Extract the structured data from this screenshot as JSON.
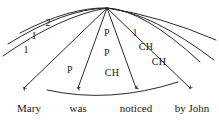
{
  "diagram": {
    "type": "stratificational-arc-diagram",
    "stroke_color": "#2a2a2a",
    "background_color": "#ffffff",
    "text_color": "#1a1a1a",
    "apex": {
      "x": 107,
      "y": 8
    },
    "words": [
      {
        "id": "word-mary",
        "label": "Mary",
        "x": 29,
        "y": 108
      },
      {
        "id": "word-was",
        "label": "was",
        "x": 78,
        "y": 108
      },
      {
        "id": "word-noticed",
        "label": "noticed",
        "x": 136,
        "y": 108
      },
      {
        "id": "word-by-john",
        "label": "by John",
        "x": 192,
        "y": 108
      }
    ],
    "cell_labels": [
      {
        "id": "label-2",
        "text": "2",
        "x": 48,
        "y": 23,
        "kind": "number"
      },
      {
        "id": "label-1-upper",
        "text": "1",
        "x": 34,
        "y": 36,
        "kind": "number"
      },
      {
        "id": "label-1-lower",
        "text": "1",
        "x": 26,
        "y": 50,
        "kind": "number"
      },
      {
        "id": "label-p-top",
        "text": "P",
        "x": 107,
        "y": 33,
        "kind": "relation"
      },
      {
        "id": "label-1-right",
        "text": "1",
        "x": 135,
        "y": 33,
        "kind": "number"
      },
      {
        "id": "label-p-mid",
        "text": "P",
        "x": 107,
        "y": 53,
        "kind": "relation"
      },
      {
        "id": "label-ch-top",
        "text": "CH",
        "x": 146,
        "y": 47,
        "kind": "relation"
      },
      {
        "id": "label-p-left",
        "text": "P",
        "x": 70,
        "y": 70,
        "kind": "relation"
      },
      {
        "id": "label-ch-mid",
        "text": "CH",
        "x": 112,
        "y": 73,
        "kind": "relation"
      },
      {
        "id": "label-ch-low",
        "text": "CH",
        "x": 159,
        "y": 62,
        "kind": "relation"
      }
    ],
    "arcs": [
      {
        "id": "arc-outer",
        "d": "M 3 56 Q 60 16 107 8 Q 160 16 216 40"
      },
      {
        "id": "arc-middle",
        "d": "M 8 44 Q 64 9 107 8 Q 152 13 214 60"
      },
      {
        "id": "arc-inner",
        "d": "M 20 33 Q 70 7 107 8 Q 144 10 200 62"
      },
      {
        "id": "arc-base",
        "d": "M 47 90 Q 110 104 178 82"
      }
    ],
    "rays": [
      {
        "id": "ray-mary",
        "d": "M 107 8 L 24 86",
        "arrow": true
      },
      {
        "id": "ray-was",
        "d": "M 107 8 L 78 86",
        "arrow": true
      },
      {
        "id": "ray-noticed",
        "d": "M 107 8 L 136 86",
        "arrow": true
      },
      {
        "id": "ray-by-john",
        "d": "M 107 8 L 190 86",
        "arrow": true
      }
    ],
    "arrowheads": [
      {
        "id": "arrowhead-mary",
        "x": 24,
        "y": 93
      },
      {
        "id": "arrowhead-was",
        "x": 78,
        "y": 93
      },
      {
        "id": "arrowhead-noticed",
        "x": 136,
        "y": 93
      },
      {
        "id": "arrowhead-by-john",
        "x": 190,
        "y": 93
      }
    ]
  }
}
